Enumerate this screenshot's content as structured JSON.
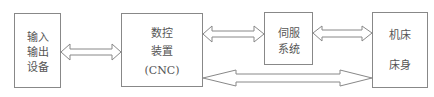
{
  "diagram": {
    "nodes": [
      {
        "id": "io",
        "lines": [
          "输入",
          "输出",
          "设备"
        ]
      },
      {
        "id": "cnc",
        "lines": [
          "数控",
          "装置",
          "(CNC)"
        ]
      },
      {
        "id": "servo",
        "lines": [
          "伺服",
          "系统"
        ]
      },
      {
        "id": "machine",
        "lines": [
          "机床",
          "床身"
        ]
      }
    ],
    "edges": [
      {
        "from": "io",
        "to": "cnc",
        "type": "bidirectional"
      },
      {
        "from": "cnc",
        "to": "servo",
        "type": "bidirectional"
      },
      {
        "from": "servo",
        "to": "machine",
        "type": "bidirectional"
      },
      {
        "from": "cnc",
        "to": "machine",
        "type": "bidirectional"
      }
    ],
    "colors": {
      "stroke": "#888888",
      "text": "#555555",
      "background": "#ffffff"
    }
  }
}
